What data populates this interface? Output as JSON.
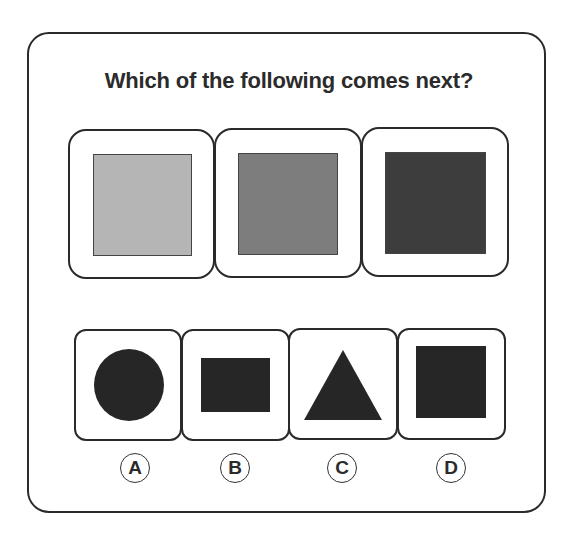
{
  "question": "Which of the following comes next?",
  "sequence": [
    {
      "shape": "square",
      "color": "#b5b5b5"
    },
    {
      "shape": "square",
      "color": "#7d7d7d"
    },
    {
      "shape": "square",
      "color": "#3d3d3d"
    }
  ],
  "options": [
    {
      "label": "A",
      "shape": "circle",
      "color": "#262626"
    },
    {
      "label": "B",
      "shape": "rectangle",
      "color": "#262626"
    },
    {
      "label": "C",
      "shape": "triangle",
      "color": "#262626"
    },
    {
      "label": "D",
      "shape": "square",
      "color": "#262626"
    }
  ]
}
